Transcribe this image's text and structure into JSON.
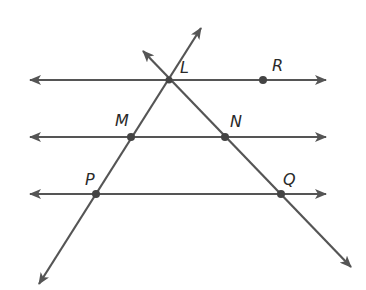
{
  "diagram": {
    "type": "geometry",
    "colors": {
      "line": "#555555",
      "point": "#444444",
      "label": "#2a2a2a",
      "background": "#ffffff"
    },
    "points": [
      {
        "name": "L",
        "x": 169,
        "y": 80
      },
      {
        "name": "R",
        "x": 263,
        "y": 80
      },
      {
        "name": "M",
        "x": 131,
        "y": 137
      },
      {
        "name": "N",
        "x": 225,
        "y": 137
      },
      {
        "name": "P",
        "x": 96,
        "y": 194
      },
      {
        "name": "Q",
        "x": 281,
        "y": 194
      }
    ],
    "labels": {
      "L": "L",
      "R": "R",
      "M": "M",
      "N": "N",
      "P": "P",
      "Q": "Q"
    },
    "lines": [
      {
        "id": "line-LR",
        "through": [
          "L",
          "R"
        ],
        "orientation": "horizontal"
      },
      {
        "id": "line-MN",
        "through": [
          "M",
          "N"
        ],
        "orientation": "horizontal"
      },
      {
        "id": "line-PQ",
        "through": [
          "P",
          "Q"
        ],
        "orientation": "horizontal"
      },
      {
        "id": "transversal-LMP",
        "through": [
          "L",
          "M",
          "P"
        ]
      },
      {
        "id": "transversal-LNQ",
        "through": [
          "L",
          "N",
          "Q"
        ]
      }
    ]
  }
}
